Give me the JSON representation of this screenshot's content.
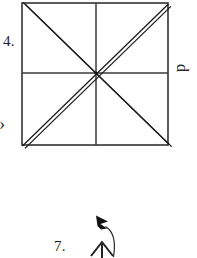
{
  "page": {
    "background_color": "#ffffff",
    "ink_color": "#1c1c1c",
    "width": 197,
    "height": 258
  },
  "figures": [
    {
      "id": "figure-4",
      "number_label": "4.",
      "shape": "square-with-diagonals-and-midlines",
      "description": "Square divided by two double-stroke diagonals and single vertical and horizontal midlines meeting at the center",
      "square": {
        "left": 22,
        "top": 3,
        "right": 168,
        "bottom": 145,
        "stroke_color": "#333333",
        "stroke_width": 1.6
      },
      "center_point": {
        "x": 96,
        "y": 73
      },
      "midlines": {
        "vertical_x": 96,
        "horizontal_y": 73,
        "stroke_color": "#3a3a3a",
        "stroke_width": 1.5
      },
      "diagonals": {
        "style": "double-line",
        "gap": 3.2,
        "stroke_color": "#1a1a1a",
        "stroke_width": 1.25,
        "lines": [
          {
            "from": "top-left",
            "to": "bottom-right"
          },
          {
            "from": "bottom-left",
            "to": "top-right"
          }
        ]
      },
      "side_label": {
        "text": "d",
        "position": "right",
        "rotation_degrees": 90
      },
      "left_marker": {
        "text": ">",
        "position": "left-edge"
      }
    },
    {
      "id": "figure-7",
      "number_label": "7.",
      "shape": "arrow-with-curved-pointer",
      "description": "Upward arrow with chevron head and vertical stem, plus a curved leader line ending in a solid arrowhead pointing up-left",
      "up_arrow": {
        "stem_x": 102,
        "stem_bottom_y": 258,
        "stem_top_y": 243,
        "head_half_width": 9,
        "head_height": 10,
        "stroke_color": "#222222",
        "stroke_width": 2
      },
      "curved_leader": {
        "start": {
          "x": 113,
          "y": 256
        },
        "control": {
          "x": 114,
          "y": 234
        },
        "end": {
          "x": 105,
          "y": 226
        },
        "stroke_color": "#2a2a2a",
        "stroke_width": 1.2
      },
      "solid_arrowhead": {
        "tip": {
          "x": 96,
          "y": 216
        },
        "fill_color": "#111111",
        "direction": "up-left"
      }
    }
  ],
  "labels": {
    "item_4": "4.",
    "item_7": "7.",
    "side_d": "d",
    "left_caret": "›"
  }
}
